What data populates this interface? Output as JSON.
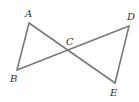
{
  "diagram": {
    "type": "geometry",
    "line_color": "#7a7a7a",
    "label_color": "#333333",
    "points": {
      "A": {
        "x": 29,
        "y": 23,
        "label": "A",
        "lx": 25,
        "ly": 17
      },
      "B": {
        "x": 17,
        "y": 70,
        "label": "B",
        "lx": 10,
        "ly": 82
      },
      "C": {
        "x": 68,
        "y": 51,
        "label": "C",
        "lx": 66,
        "ly": 45
      },
      "D": {
        "x": 129,
        "y": 26,
        "label": "D",
        "lx": 127,
        "ly": 20
      },
      "E": {
        "x": 115,
        "y": 83,
        "label": "E",
        "lx": 110,
        "ly": 96
      }
    },
    "segments": [
      {
        "from": "A",
        "to": "B"
      },
      {
        "from": "A",
        "to": "E"
      },
      {
        "from": "B",
        "to": "D"
      },
      {
        "from": "D",
        "to": "E"
      }
    ]
  }
}
